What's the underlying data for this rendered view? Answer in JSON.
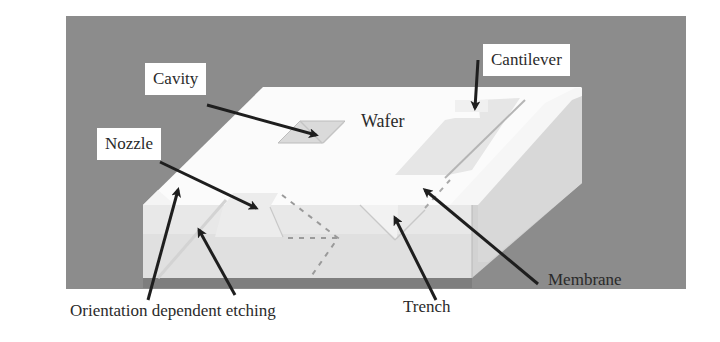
{
  "figure": {
    "colors": {
      "background_panel": "#8c8c8c",
      "wafer_top": "#fbfbfb",
      "wafer_front": "#dedede",
      "wafer_right": "#cfcfcf",
      "wafer_bottom_shadow": "#808080",
      "arrow": "#1e1e1e",
      "dashed_line": "#9a9a9a"
    },
    "labels": {
      "cavity": "Cavity",
      "nozzle": "Nozzle",
      "wafer": "Wafer",
      "cantilever": "Cantilever",
      "membrane": "Membrane",
      "trench": "Trench",
      "orientation_dependent_etching": "Orientation dependent etching"
    }
  }
}
